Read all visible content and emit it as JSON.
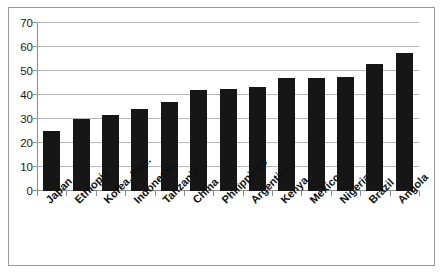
{
  "chart_data": {
    "type": "bar",
    "title": "",
    "xlabel": "",
    "ylabel": "",
    "categories": [
      "Japan",
      "Ethiopia",
      "Korea, Rep.",
      "Indonesia",
      "Tanzania",
      "China",
      "Philippines",
      "Argentina",
      "Kenya",
      "Mexico",
      "Nigeria",
      "Brazil",
      "Angola"
    ],
    "values": [
      25,
      30,
      31.5,
      34,
      37,
      42,
      42.5,
      43.5,
      47,
      47,
      47.5,
      53,
      57.5
    ],
    "ylim": [
      0,
      70
    ],
    "yticks": [
      0,
      10,
      20,
      30,
      40,
      50,
      60,
      70
    ],
    "ytick_labels": [
      "0",
      "10",
      "20",
      "30",
      "40",
      "50",
      "60",
      "70"
    ],
    "grid": true,
    "legend": false,
    "bar_color": "#161616",
    "gridline_color": "#b6b6b6",
    "axis_color": "#8c8c8c",
    "frame_color": "#9a9a9a",
    "background": "#ffffff"
  }
}
